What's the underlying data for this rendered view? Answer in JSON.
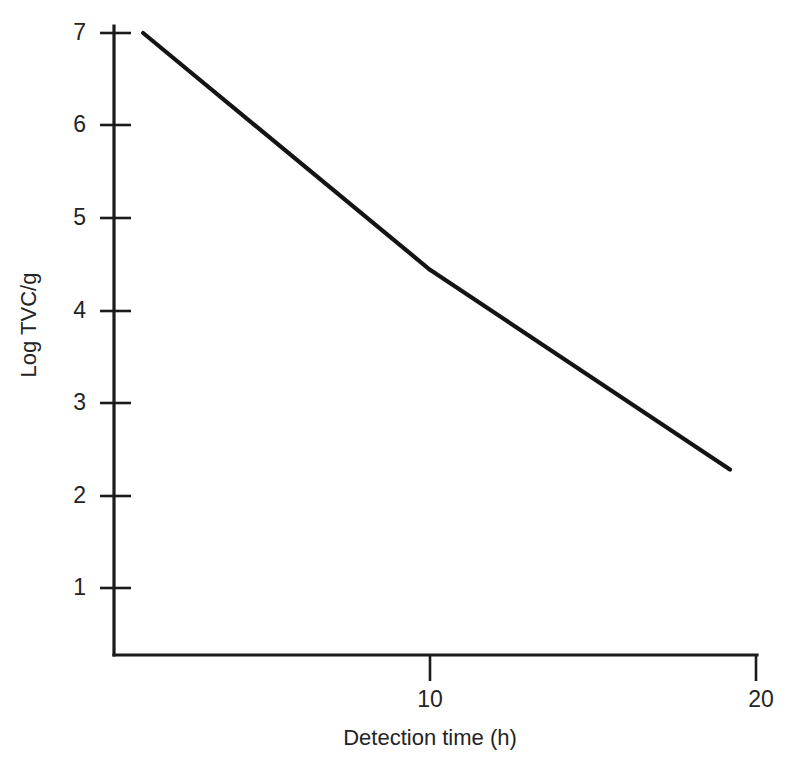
{
  "chart_data": {
    "type": "line",
    "title": "",
    "xlabel": "Detection  time (h)",
    "ylabel": "Log TVC/g",
    "xlim": [
      0.6,
      20.6
    ],
    "ylim": [
      0.28,
      7.0
    ],
    "xticks": [
      10,
      20
    ],
    "xtick_labels": [
      "10",
      "20"
    ],
    "yticks": [
      1,
      2,
      3,
      4,
      5,
      6,
      7
    ],
    "ytick_labels": [
      "1",
      "2",
      "3",
      "4",
      "5",
      "6",
      "7"
    ],
    "grid": false,
    "legend": false,
    "legend_position": "none",
    "series": [
      {
        "name": "Log TVC/g vs detection time",
        "color": "#141414",
        "x": [
          1.2,
          10.0,
          19.2
        ],
        "values": [
          7.0,
          4.44,
          2.28
        ]
      }
    ],
    "annotations": []
  },
  "figure": {
    "background_color": "#ffffff",
    "axis_color": "#1b1b1b",
    "text_color": "#242424",
    "line_color": "#141414"
  },
  "axes": {
    "y_axis": {
      "label": "Log TVC/g",
      "ticks": [
        {
          "label": "7",
          "value": 7
        },
        {
          "label": "6",
          "value": 6
        },
        {
          "label": "5",
          "value": 5
        },
        {
          "label": "4",
          "value": 4
        },
        {
          "label": "3",
          "value": 3
        },
        {
          "label": "2",
          "value": 2
        },
        {
          "label": "1",
          "value": 1
        }
      ]
    },
    "x_axis": {
      "label": "Detection  time (h)",
      "ticks": [
        {
          "label": "10",
          "value": 10
        },
        {
          "label": "20",
          "value": 20
        }
      ]
    }
  }
}
